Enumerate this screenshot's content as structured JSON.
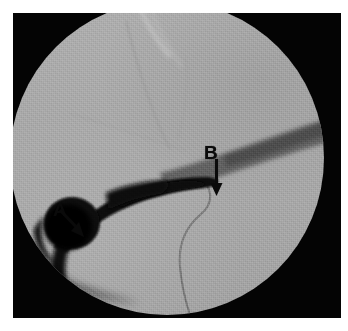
{
  "figure": {
    "kind": "fluoroscopic-cholangiogram",
    "page_background": "#ffffff",
    "panel_background": "#040404",
    "field_background": "#a9a9a9",
    "annotation_color": "#0a0a0a"
  },
  "annotations": [
    {
      "id": "a",
      "label": "A",
      "arrow": "diagonal-down-right",
      "letter_position": {
        "x": 40,
        "y": 187
      },
      "arrow_tip": {
        "x": 70,
        "y": 218
      }
    },
    {
      "id": "b",
      "label": "B",
      "arrow": "vertical-down",
      "letter_position": {
        "x": 191,
        "y": 130
      },
      "arrow_tip": {
        "x": 201,
        "y": 179
      }
    }
  ],
  "structures": [
    {
      "id": "contrast-duct",
      "name": "contrast-filled-duct",
      "tone": "#0b0b0b"
    },
    {
      "id": "round-opacity",
      "name": "round-dark-opacity",
      "tone": "#090909"
    },
    {
      "id": "dark-band",
      "name": "dark-diagonal-band",
      "tone": "#5a5a5a"
    },
    {
      "id": "catheter",
      "name": "thin-catheter-line",
      "tone": "#7b7b7b"
    },
    {
      "id": "soft-tissue-edge",
      "name": "soft-tissue-edge-line",
      "tone": "#9a9a9a"
    },
    {
      "id": "bright-streak",
      "name": "bright-streak-top",
      "tone": "#d0d0d0"
    }
  ]
}
